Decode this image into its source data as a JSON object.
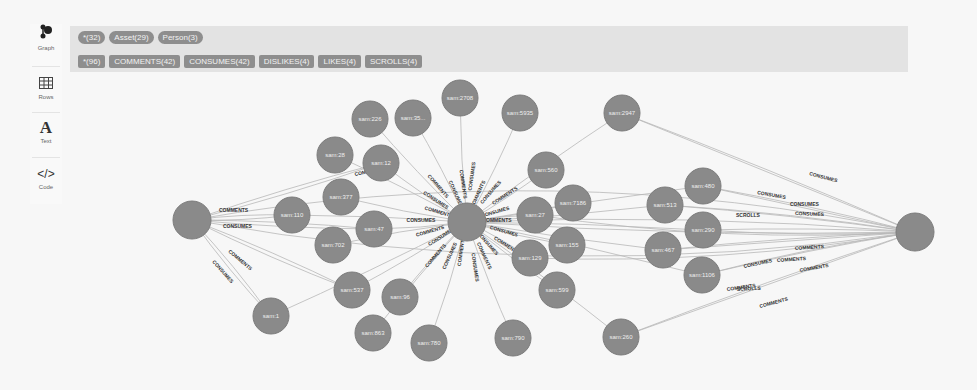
{
  "sidebar": {
    "items": [
      {
        "label": "Graph",
        "icon": "graph-icon",
        "active": true
      },
      {
        "label": "Rows",
        "icon": "table-icon",
        "active": false
      },
      {
        "label": "Text",
        "icon": "text-icon",
        "active": false
      },
      {
        "label": "Code",
        "icon": "code-icon",
        "active": false
      }
    ]
  },
  "topbar": {
    "node_labels": [
      {
        "label": "*(32)"
      },
      {
        "label": "Asset(29)"
      },
      {
        "label": "Person(3)"
      }
    ],
    "relationship_types": [
      {
        "label": "*(96)"
      },
      {
        "label": "COMMENTS(42)"
      },
      {
        "label": "CONSUMES(42)"
      },
      {
        "label": "DISLIKES(4)"
      },
      {
        "label": "LIKES(4)"
      },
      {
        "label": "SCROLLS(4)"
      }
    ]
  },
  "colors": {
    "node_fill": "#8a8a8a",
    "edge": "#b8b8b8",
    "pill": "#8e8e8e",
    "topbar": "#e3e3e3"
  },
  "graph": {
    "persons": [
      {
        "id": "p1",
        "x": 192,
        "y": 220,
        "r": 19
      },
      {
        "id": "p2",
        "x": 467,
        "y": 222,
        "r": 19
      },
      {
        "id": "p3",
        "x": 915,
        "y": 232,
        "r": 19
      }
    ],
    "assets": [
      {
        "label": "sam:226",
        "x": 370,
        "y": 119,
        "r": 18
      },
      {
        "label": "sam:35...",
        "x": 413,
        "y": 118,
        "r": 18
      },
      {
        "label": "sam:2708",
        "x": 460,
        "y": 98,
        "r": 18
      },
      {
        "label": "sam:5935",
        "x": 520,
        "y": 113,
        "r": 18
      },
      {
        "label": "sam:2947",
        "x": 622,
        "y": 113,
        "r": 18
      },
      {
        "label": "sam:28",
        "x": 335,
        "y": 155,
        "r": 18
      },
      {
        "label": "sam:12",
        "x": 381,
        "y": 163,
        "r": 18
      },
      {
        "label": "sam:560",
        "x": 546,
        "y": 170,
        "r": 18
      },
      {
        "label": "sam:377",
        "x": 341,
        "y": 197,
        "r": 18
      },
      {
        "label": "sam:110",
        "x": 292,
        "y": 215,
        "r": 18
      },
      {
        "label": "sam:47",
        "x": 374,
        "y": 229,
        "r": 18
      },
      {
        "label": "sam:702",
        "x": 333,
        "y": 245,
        "r": 18
      },
      {
        "label": "sam:27",
        "x": 535,
        "y": 215,
        "r": 18
      },
      {
        "label": "sam:7186",
        "x": 573,
        "y": 203,
        "r": 18
      },
      {
        "label": "sam:129",
        "x": 530,
        "y": 258,
        "r": 18
      },
      {
        "label": "sam:155",
        "x": 567,
        "y": 245,
        "r": 18
      },
      {
        "label": "sam:480",
        "x": 703,
        "y": 186,
        "r": 18
      },
      {
        "label": "sam:513",
        "x": 665,
        "y": 205,
        "r": 18
      },
      {
        "label": "sam:290",
        "x": 703,
        "y": 230,
        "r": 18
      },
      {
        "label": "sam:467",
        "x": 663,
        "y": 250,
        "r": 18
      },
      {
        "label": "sam:1106",
        "x": 702,
        "y": 275,
        "r": 18
      },
      {
        "label": "sam:599",
        "x": 557,
        "y": 290,
        "r": 18
      },
      {
        "label": "sam:537",
        "x": 352,
        "y": 290,
        "r": 18
      },
      {
        "label": "sam:96",
        "x": 400,
        "y": 297,
        "r": 18
      },
      {
        "label": "sam:1",
        "x": 271,
        "y": 316,
        "r": 18
      },
      {
        "label": "sam:863",
        "x": 373,
        "y": 333,
        "r": 18
      },
      {
        "label": "sam:780",
        "x": 429,
        "y": 343,
        "r": 18
      },
      {
        "label": "sam:790",
        "x": 513,
        "y": 338,
        "r": 18
      },
      {
        "label": "sam:260",
        "x": 621,
        "y": 337,
        "r": 18
      }
    ],
    "edge_labels": [
      {
        "text": "COMMENTS",
        "x": 219,
        "y": 212,
        "rot": 0
      },
      {
        "text": "CONSUMES",
        "x": 223,
        "y": 228,
        "rot": 0
      },
      {
        "text": "COMMENTS",
        "x": 228,
        "y": 252,
        "rot": 40
      },
      {
        "text": "CONSUMES",
        "x": 212,
        "y": 262,
        "rot": 48
      },
      {
        "text": "CONSUMES",
        "x": 757,
        "y": 194,
        "rot": 10
      },
      {
        "text": "CONSUMES",
        "x": 790,
        "y": 206,
        "rot": 0
      },
      {
        "text": "CONSUMES",
        "x": 795,
        "y": 215,
        "rot": 2
      },
      {
        "text": "SCROLLS",
        "x": 736,
        "y": 217,
        "rot": 0
      },
      {
        "text": "COMMENTS",
        "x": 795,
        "y": 250,
        "rot": -4
      },
      {
        "text": "COMMENTS",
        "x": 777,
        "y": 262,
        "rot": -4
      },
      {
        "text": "COMMENTS",
        "x": 800,
        "y": 272,
        "rot": -10
      },
      {
        "text": "COMMENTS",
        "x": 727,
        "y": 291,
        "rot": -8
      },
      {
        "text": "SCROLLS",
        "x": 737,
        "y": 291,
        "rot": -3
      },
      {
        "text": "COMMENTS",
        "x": 760,
        "y": 308,
        "rot": -15
      },
      {
        "text": "CONSUMES",
        "x": 744,
        "y": 268,
        "rot": -12
      },
      {
        "text": "CONSUMES",
        "x": 809,
        "y": 175,
        "rot": 15
      },
      {
        "text": "COMMENTS",
        "x": 355,
        "y": 176,
        "rot": -12
      }
    ]
  }
}
